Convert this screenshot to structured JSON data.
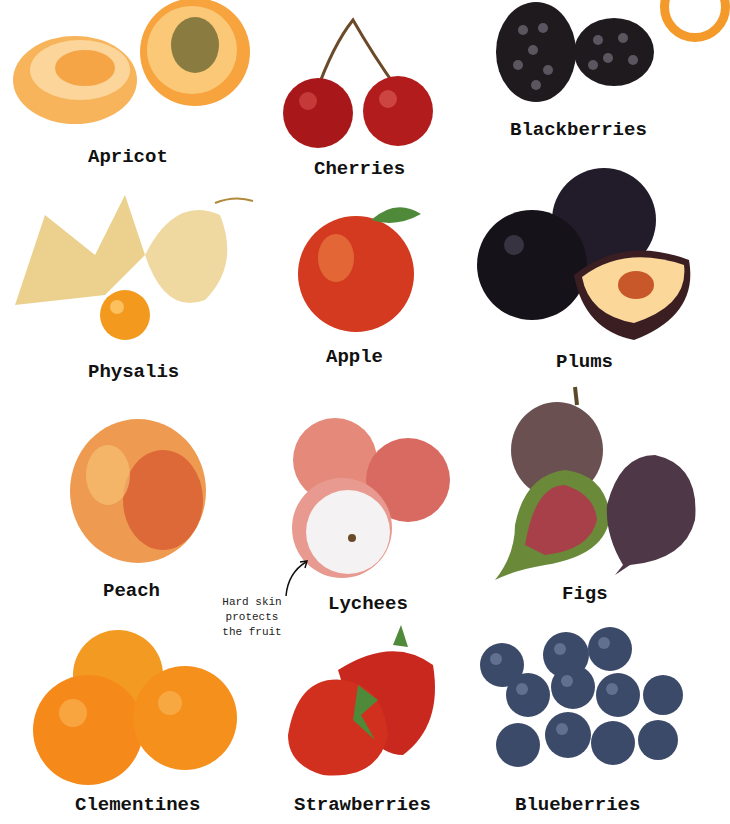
{
  "page": {
    "fruits": [
      {
        "name": "Apricot",
        "color": "#f6a94a"
      },
      {
        "name": "Cherries",
        "color": "#a81e1e"
      },
      {
        "name": "Blackberries",
        "color": "#1e1a1e"
      },
      {
        "name": "Physalis",
        "color": "#f08a1a"
      },
      {
        "name": "Apple",
        "color": "#d8351e"
      },
      {
        "name": "Plums",
        "color": "#221c2a"
      },
      {
        "name": "Peach",
        "color": "#ee9a50"
      },
      {
        "name": "Lychees",
        "color": "#e07a72"
      },
      {
        "name": "Figs",
        "color": "#5a4048"
      },
      {
        "name": "Clementines",
        "color": "#f39020"
      },
      {
        "name": "Strawberries",
        "color": "#d2281e"
      },
      {
        "name": "Blueberries",
        "color": "#3c4a6a"
      }
    ],
    "annotation": {
      "line1": "Hard skin",
      "line2": "protects",
      "line3": "the fruit"
    }
  }
}
